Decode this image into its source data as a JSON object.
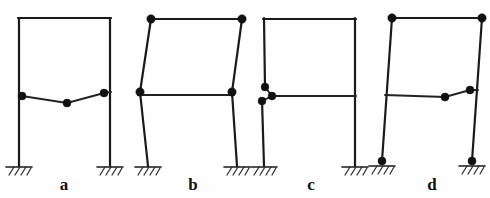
{
  "figure": {
    "title": "",
    "background_color": "#fefefe",
    "line_color": "#1a1a1a",
    "hinge_color": "#111111",
    "width": 490,
    "height": 198
  },
  "frames": [
    {
      "id": "frame-a",
      "label": "a",
      "label_x": 64,
      "label_y": 190,
      "description": "Portal frame, fixed bases, three hinges in mid-height beam",
      "columns": [
        {
          "name": "left-column",
          "x1": 19,
          "y1": 18,
          "x2": 19,
          "y2": 166
        },
        {
          "name": "right-column",
          "x1": 110,
          "y1": 18,
          "x2": 110,
          "y2": 166
        }
      ],
      "beams": [
        {
          "name": "top-beam",
          "x1": 19,
          "y1": 18,
          "x2": 110,
          "y2": 18
        },
        {
          "name": "mid-beam-left-segment",
          "x1": 22,
          "y1": 96,
          "x2": 67,
          "y2": 103
        },
        {
          "name": "mid-beam-right-segment",
          "x1": 67,
          "y1": 103,
          "x2": 104,
          "y2": 93
        },
        {
          "name": "mid-beam-end-stub",
          "x1": 104,
          "y1": 93,
          "x2": 111,
          "y2": 92
        }
      ],
      "hinges": [
        {
          "name": "hinge-left",
          "cx": 22,
          "cy": 96,
          "r": 4.0
        },
        {
          "name": "hinge-mid",
          "cx": 67,
          "cy": 103,
          "r": 4.0
        },
        {
          "name": "hinge-right",
          "cx": 104,
          "cy": 93,
          "r": 4.0
        }
      ],
      "supports": [
        {
          "name": "support-left-fixed",
          "x": 19,
          "y": 166,
          "type": "fixed"
        },
        {
          "name": "support-right-fixed",
          "x": 110,
          "y": 166,
          "type": "fixed"
        }
      ]
    },
    {
      "id": "frame-b",
      "label": "b",
      "label_x": 193,
      "label_y": 190,
      "description": "Portal frame, fixed bases, sway mechanism of upper storey with four hinges",
      "columns": [
        {
          "name": "left-column-lower",
          "x1": 148,
          "y1": 166,
          "x2": 140,
          "y2": 92
        },
        {
          "name": "left-column-upper",
          "x1": 140,
          "y1": 92,
          "x2": 151,
          "y2": 19
        },
        {
          "name": "right-column-lower",
          "x1": 237,
          "y1": 166,
          "x2": 232,
          "y2": 92
        },
        {
          "name": "right-column-upper",
          "x1": 232,
          "y1": 92,
          "x2": 242,
          "y2": 19
        }
      ],
      "beams": [
        {
          "name": "top-beam",
          "x1": 151,
          "y1": 19,
          "x2": 242,
          "y2": 19
        },
        {
          "name": "mid-beam",
          "x1": 139,
          "y1": 95,
          "x2": 233,
          "y2": 95
        }
      ],
      "hinges": [
        {
          "name": "hinge-top-left",
          "cx": 151,
          "cy": 19,
          "r": 4.2
        },
        {
          "name": "hinge-top-right",
          "cx": 242,
          "cy": 19,
          "r": 4.2
        },
        {
          "name": "hinge-mid-left",
          "cx": 140,
          "cy": 92,
          "r": 4.2
        },
        {
          "name": "hinge-mid-right",
          "cx": 232,
          "cy": 92,
          "r": 4.2
        }
      ],
      "supports": [
        {
          "name": "support-left-fixed",
          "x": 148,
          "y": 166,
          "type": "fixed"
        },
        {
          "name": "support-right-fixed",
          "x": 237,
          "y": 166,
          "type": "fixed"
        }
      ]
    },
    {
      "id": "frame-c",
      "label": "c",
      "label_x": 311,
      "label_y": 190,
      "description": "Portal frame, fixed bases, local mechanism at left beam-column joint with three clustered hinges",
      "columns": [
        {
          "name": "left-column-upper",
          "x1": 264,
          "y1": 19,
          "x2": 265,
          "y2": 87
        },
        {
          "name": "left-column-lower",
          "x1": 262,
          "y1": 101,
          "x2": 264,
          "y2": 166
        },
        {
          "name": "right-column",
          "x1": 355,
          "y1": 19,
          "x2": 355,
          "y2": 166
        }
      ],
      "beams": [
        {
          "name": "top-beam",
          "x1": 264,
          "y1": 19,
          "x2": 355,
          "y2": 19
        },
        {
          "name": "mid-beam",
          "x1": 272,
          "y1": 96,
          "x2": 356,
          "y2": 96
        },
        {
          "name": "joint-link-upper",
          "x1": 265,
          "y1": 87,
          "x2": 272,
          "y2": 96
        },
        {
          "name": "joint-link-lower",
          "x1": 262,
          "y1": 101,
          "x2": 272,
          "y2": 96
        }
      ],
      "hinges": [
        {
          "name": "hinge-column-above",
          "cx": 265,
          "cy": 87,
          "r": 3.9
        },
        {
          "name": "hinge-column-below",
          "cx": 262,
          "cy": 101,
          "r": 3.9
        },
        {
          "name": "hinge-beam-end",
          "cx": 272,
          "cy": 96,
          "r": 3.9
        }
      ],
      "supports": [
        {
          "name": "support-left-fixed",
          "x": 264,
          "y": 166,
          "type": "fixed"
        },
        {
          "name": "support-right-fixed",
          "x": 355,
          "y": 166,
          "type": "fixed"
        }
      ]
    },
    {
      "id": "frame-d",
      "label": "d",
      "label_x": 432,
      "label_y": 190,
      "description": "Portal frame, hinged bases, combined mechanism with hinges at bases, top corners and mid beam",
      "columns": [
        {
          "name": "left-column",
          "x1": 392,
          "y1": 18,
          "x2": 382,
          "y2": 161
        },
        {
          "name": "right-column",
          "x1": 482,
          "y1": 18,
          "x2": 472,
          "y2": 161
        }
      ],
      "beams": [
        {
          "name": "top-beam",
          "x1": 392,
          "y1": 18,
          "x2": 482,
          "y2": 18
        },
        {
          "name": "mid-beam-left-segment",
          "x1": 385,
          "y1": 95,
          "x2": 445,
          "y2": 97
        },
        {
          "name": "mid-beam-right-segment",
          "x1": 445,
          "y1": 97,
          "x2": 470,
          "y2": 90
        },
        {
          "name": "mid-beam-end-stub",
          "x1": 470,
          "y1": 90,
          "x2": 477,
          "y2": 90
        }
      ],
      "hinges": [
        {
          "name": "hinge-top-left",
          "cx": 392,
          "cy": 18,
          "r": 4.2
        },
        {
          "name": "hinge-top-right",
          "cx": 482,
          "cy": 18,
          "r": 4.2
        },
        {
          "name": "hinge-mid-beam",
          "cx": 445,
          "cy": 97,
          "r": 4.0
        },
        {
          "name": "hinge-mid-right",
          "cx": 470,
          "cy": 90,
          "r": 4.0
        },
        {
          "name": "hinge-base-left",
          "cx": 382,
          "cy": 161,
          "r": 4.0
        },
        {
          "name": "hinge-base-right",
          "cx": 472,
          "cy": 161,
          "r": 4.0
        }
      ],
      "supports": [
        {
          "name": "support-left-fixed",
          "x": 382,
          "y": 164,
          "type": "fixed"
        },
        {
          "name": "support-right-fixed",
          "x": 472,
          "y": 164,
          "type": "fixed"
        }
      ]
    }
  ]
}
